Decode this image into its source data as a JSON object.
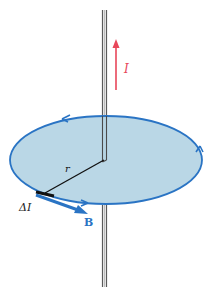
{
  "diagram": {
    "labels": {
      "current": "I",
      "radius": "r",
      "element": "ΔI",
      "field": "B"
    },
    "colors": {
      "current_arrow": "#e8475a",
      "field_loop": "#2a74c4",
      "loop_fill": "#b4d4e4",
      "field_vector": "#2a74c4",
      "wire": "#6e6e6e",
      "radius_line": "#111111"
    }
  }
}
